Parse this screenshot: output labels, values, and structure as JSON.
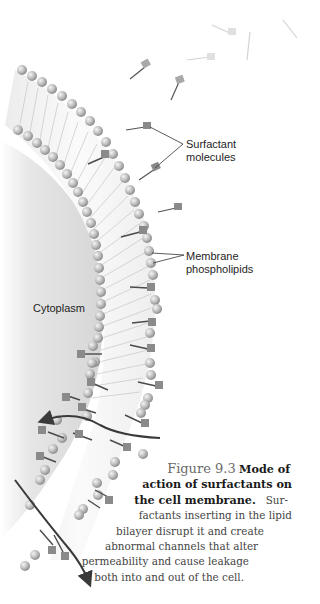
{
  "figure": {
    "type": "scientific-illustration",
    "colors": {
      "background": "#ffffff",
      "cytoplasm_shade": "#d9d9d9",
      "bead": "#b8b8b8",
      "bead_highlight": "#eeeeee",
      "surfactant_head": "#8a8a8a",
      "surfactant_tail": "#4a4a4a",
      "arrow": "#3a3a3a",
      "label_text": "#1e1e1e",
      "caption_number": "#6b6b6b",
      "caption_text": "#444444"
    }
  },
  "labels": {
    "surfactant": [
      "Surfactant",
      "molecules"
    ],
    "phospholipids": [
      "Membrane",
      "phospholipids"
    ],
    "cytoplasm": "Cytoplasm"
  },
  "caption": {
    "number": "Figure 9.3",
    "title_lines": [
      "Mode of",
      "action of surfactants on",
      "the cell membrane."
    ],
    "body_lines": [
      "Sur-",
      "factants inserting in the lipid",
      "bilayer disrupt it and create",
      "abnormal channels that alter",
      "permeability and cause leakage",
      "both into and out of the cell."
    ]
  }
}
